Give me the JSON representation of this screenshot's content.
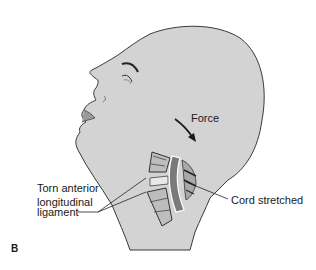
{
  "figure": {
    "panel_label": "B",
    "labels": {
      "force": "Force",
      "torn_ligament_line1": "Torn anterior",
      "torn_ligament_line2": "longitudinal",
      "torn_ligament_line3": "ligament",
      "cord": "Cord stretched"
    },
    "colors": {
      "skin": "#d3d3d3",
      "outline": "#3a3a3a",
      "vertebra": "#bdbdbd",
      "cord": "#7a7a7a",
      "text": "#1a1a1a",
      "background": "#ffffff"
    }
  }
}
